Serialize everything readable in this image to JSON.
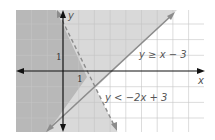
{
  "diagram": {
    "type": "linear inequalities graph",
    "axes": {
      "x_label": "x",
      "y_label": "y",
      "tick_x": "1",
      "tick_y": "1"
    },
    "inequalities": [
      {
        "label": "y ≥ x − 3",
        "boundary": "solid",
        "slope": 1,
        "intercept": -3
      },
      {
        "label": "y < −2x + 3",
        "boundary": "dashed",
        "slope": -2,
        "intercept": 3
      }
    ],
    "colors": {
      "grid": "#c8c8c8",
      "light_shade": "#d9d9d9",
      "dark_shade": "#b3b3b3",
      "line": "#8c8c8c",
      "axis": "#111111"
    }
  }
}
